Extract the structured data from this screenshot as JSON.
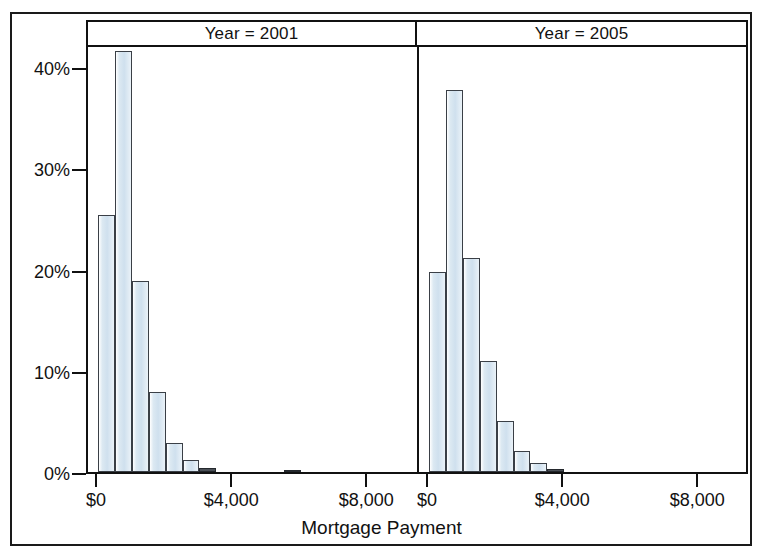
{
  "chart_data": {
    "type": "bar",
    "title": "",
    "subtitle": "",
    "xlabel": "Mortgage Payment",
    "ylabel": "",
    "grid": false,
    "legend": "none",
    "facet_variable": "Year",
    "facets": [
      {
        "label": "Year = 2001",
        "bin_width": 500,
        "bin_starts": [
          0,
          500,
          1000,
          1500,
          2000,
          2500,
          3000,
          5500
        ],
        "bin_centers": [
          250,
          750,
          1250,
          1750,
          2250,
          2750,
          3250,
          5750
        ],
        "values": [
          25.4,
          41.6,
          18.9,
          7.9,
          2.9,
          1.2,
          0.4,
          0.2
        ],
        "value_unit": "percent"
      },
      {
        "label": "Year = 2005",
        "bin_width": 500,
        "bin_starts": [
          0,
          500,
          1000,
          1500,
          2000,
          2500,
          3000,
          3500
        ],
        "bin_centers": [
          250,
          750,
          1250,
          1750,
          2250,
          2750,
          3250,
          3750
        ],
        "values": [
          19.8,
          37.8,
          21.2,
          11.0,
          5.0,
          2.1,
          0.9,
          0.3
        ],
        "value_unit": "percent"
      }
    ],
    "x_ticks": [
      0,
      4000,
      8000
    ],
    "x_tick_labels": [
      "$0",
      "$4,000",
      "$8,000"
    ],
    "xlim": [
      -300,
      9500
    ],
    "y_ticks": [
      0,
      10,
      20,
      30,
      40
    ],
    "y_tick_labels": [
      "0%",
      "10%",
      "20%",
      "30%",
      "40%"
    ],
    "ylim": [
      0,
      42.2
    ],
    "colors": {
      "bar_fill": "#cfe0ee",
      "bar_edge": "#3a3f46",
      "axis": "#111111",
      "background": "#ffffff"
    }
  },
  "figure": {
    "x_axis_title": "Mortgage Payment",
    "panel_headers": [
      "Year = 2001",
      "Year = 2005"
    ],
    "y_tick_labels": [
      "40%",
      "30%",
      "20%",
      "10%",
      "0%"
    ],
    "x_tick_labels_left": [
      "$0",
      "$4,000",
      "$8,000"
    ],
    "x_tick_labels_right": [
      "$0",
      "$4,000",
      "$8,000"
    ]
  }
}
